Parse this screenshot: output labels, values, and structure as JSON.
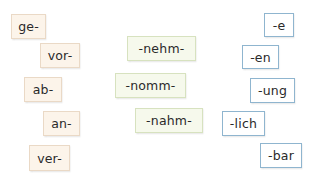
{
  "colors": {
    "prefix_bg": "#fcf4ea",
    "prefix_border": "#ead9c6",
    "stem_bg": "#f6f9ec",
    "stem_border": "#d7e2bf",
    "suffix_bg": "#ffffff",
    "suffix_border": "#8fb5cf"
  },
  "prefixes": [
    {
      "label": "ge-"
    },
    {
      "label": "vor-"
    },
    {
      "label": "ab-"
    },
    {
      "label": "an-"
    },
    {
      "label": "ver-"
    }
  ],
  "stems": [
    {
      "label": "-nehm-"
    },
    {
      "label": "-nomm-"
    },
    {
      "label": "-nahm-"
    }
  ],
  "suffixes": [
    {
      "label": "-e"
    },
    {
      "label": "-en"
    },
    {
      "label": "-ung"
    },
    {
      "label": "-lich"
    },
    {
      "label": "-bar"
    }
  ]
}
